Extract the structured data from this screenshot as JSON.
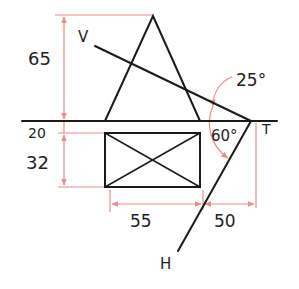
{
  "diagram": {
    "type": "orthographic-traces",
    "colors": {
      "object": "#1a1a1a",
      "dimension": "#f08a8a",
      "text": "#222222"
    },
    "labels": {
      "v": "V",
      "h": "H",
      "t": "T"
    },
    "dimensions": {
      "top_height": "65",
      "gap": "20",
      "rect_height": "32",
      "rect_width": "55",
      "offset": "50"
    },
    "angles": {
      "vt_angle": "25°",
      "ht_angle": "60°"
    }
  }
}
